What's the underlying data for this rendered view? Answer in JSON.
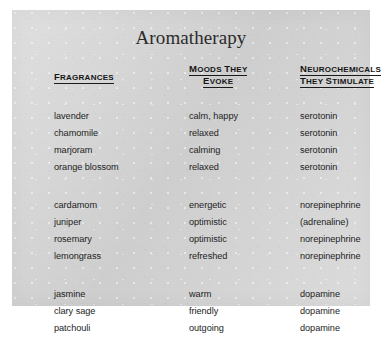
{
  "document": {
    "title": "Aromatherapy",
    "page_background": "#d3d3d3",
    "text_color": "#1d1d1d",
    "frame_color": "#ffffff"
  },
  "table": {
    "headers": {
      "fragrances": "Fragrances",
      "moods_line1": "Moods They",
      "moods_line2": "Evoke",
      "neuro_line1": "Neurochemicals",
      "neuro_line2": "They Stimulate"
    },
    "groups": [
      {
        "group_name": "serotonin-group",
        "rows": [
          {
            "fragrance": "lavender",
            "mood": "calm, happy",
            "neurochemical": "serotonin"
          },
          {
            "fragrance": "chamomile",
            "mood": "relaxed",
            "neurochemical": "serotonin"
          },
          {
            "fragrance": "marjoram",
            "mood": "calming",
            "neurochemical": "serotonin"
          },
          {
            "fragrance": "orange blossom",
            "mood": "relaxed",
            "neurochemical": "serotonin"
          }
        ]
      },
      {
        "group_name": "norepinephrine-group",
        "rows": [
          {
            "fragrance": "cardamom",
            "mood": "energetic",
            "neurochemical": "norepinephrine"
          },
          {
            "fragrance": "juniper",
            "mood": "optimistic",
            "neurochemical": "(adrenaline)"
          },
          {
            "fragrance": "rosemary",
            "mood": "optimistic",
            "neurochemical": "norepinephrine"
          },
          {
            "fragrance": "lemongrass",
            "mood": "refreshed",
            "neurochemical": "norepinephrine"
          }
        ]
      },
      {
        "group_name": "dopamine-group",
        "rows": [
          {
            "fragrance": "jasmine",
            "mood": "warm",
            "neurochemical": "dopamine"
          },
          {
            "fragrance": "clary sage",
            "mood": "friendly",
            "neurochemical": "dopamine"
          },
          {
            "fragrance": "patchouli",
            "mood": "outgoing",
            "neurochemical": "dopamine"
          }
        ]
      }
    ]
  }
}
